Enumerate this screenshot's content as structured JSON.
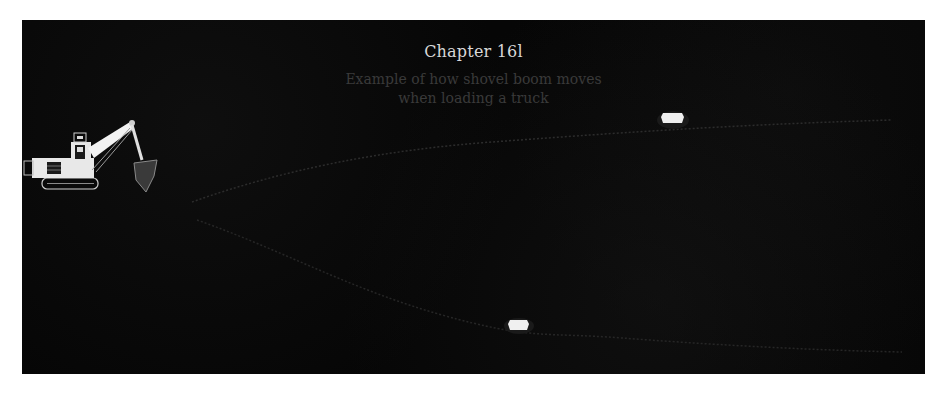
{
  "figure": {
    "title": "Chapter 16l",
    "caption_line1": "Example of how shovel boom moves",
    "caption_line2": "when loading a truck"
  },
  "elements": {
    "shovel": "shovel-excavator-icon",
    "truck_upper": "truck-icon",
    "truck_lower": "truck-icon",
    "path_upper": "haul-path-upper",
    "path_lower": "haul-path-lower"
  },
  "colors": {
    "background": "#060606",
    "title": "#d8d8d8",
    "caption": "#3a3a3a",
    "shovel": "#e6e6e6",
    "truck": "#f0f0f0",
    "path": "#2a2a2a",
    "page": "#ffffff"
  }
}
